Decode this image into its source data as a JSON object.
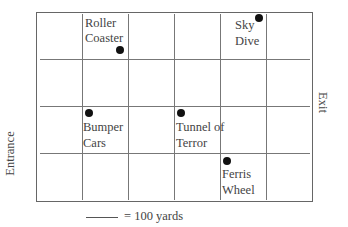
{
  "diagram": {
    "type": "park-map-grid",
    "grid": {
      "columns": 6,
      "rows": 4
    },
    "side_labels": {
      "left": "Entrance",
      "right": "Exit"
    },
    "scale": {
      "text": "= 100 yards"
    },
    "attractions": [
      {
        "name": "Roller Coaster",
        "line1": "Roller",
        "line2": "Coaster"
      },
      {
        "name": "Sky Dive",
        "line1": "Sky",
        "line2": "Dive"
      },
      {
        "name": "Bumper Cars",
        "line1": "Bumper",
        "line2": "Cars"
      },
      {
        "name": "Tunnel of Terror",
        "line1": "Tunnel of",
        "line2": "Terror"
      },
      {
        "name": "Ferris Wheel",
        "line1": "Ferris",
        "line2": "Wheel"
      }
    ]
  }
}
